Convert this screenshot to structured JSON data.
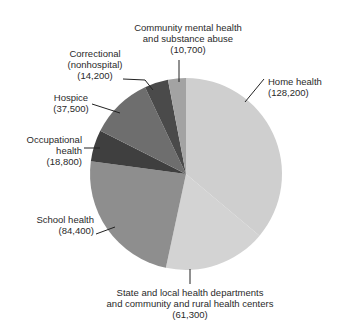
{
  "chart_data": {
    "type": "pie",
    "title": "",
    "start_angle_deg": 0,
    "direction": "clockwise",
    "center": [
      186,
      174
    ],
    "radius": 96,
    "slices": [
      {
        "label": "Home health",
        "value": 128200,
        "value_text": "(128,200)",
        "color": "#cfcfcf"
      },
      {
        "label": "State and local health departments and community and rural health centers",
        "value": 61300,
        "value_text": "(61,300)",
        "color": "#d3d3d3"
      },
      {
        "label": "School health",
        "value": 84400,
        "value_text": "(84,400)",
        "color": "#8e8e8e"
      },
      {
        "label": "Occupational health",
        "value": 18800,
        "value_text": "(18,800)",
        "color": "#3f3f3f"
      },
      {
        "label": "Hospice",
        "value": 37500,
        "value_text": "(37,500)",
        "color": "#6e6e6e"
      },
      {
        "label": "Correctional (nonhospital)",
        "value": 14200,
        "value_text": "(14,200)",
        "color": "#4a4a4a"
      },
      {
        "label": "Community mental health and substance abuse",
        "value": 10700,
        "value_text": "(10,700)",
        "color": "#a3a3a3"
      }
    ]
  },
  "labels": {
    "community": {
      "line1": "Community mental health",
      "line2": "and substance abuse",
      "line3": "(10,700)"
    },
    "correctional": {
      "line1": "Correctional",
      "line2": "(nonhospital)",
      "line3": "(14,200)"
    },
    "hospice": {
      "line1": "Hospice",
      "line2": "(37,500)"
    },
    "occupational": {
      "line1": "Occupational",
      "line2": "health",
      "line3": "(18,800)"
    },
    "school": {
      "line1": "School health",
      "line2": "(84,400)"
    },
    "home": {
      "line1": "Home health",
      "line2": "(128,200)"
    },
    "state": {
      "line1": "State and local health departments",
      "line2": "and community and rural health centers",
      "line3": "(61,300)"
    }
  }
}
